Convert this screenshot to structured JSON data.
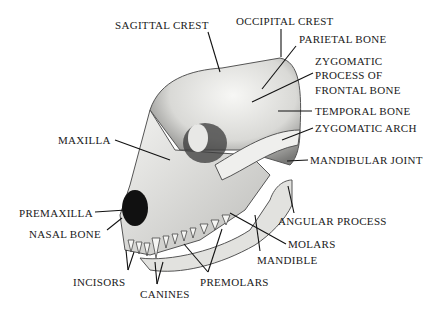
{
  "labels": {
    "sagittal_crest": "SAGITTAL CREST",
    "occipital_crest": "OCCIPITAL CREST",
    "parietal_bone": "PARIETAL BONE",
    "zygomatic_process_line1": "ZYGOMATIC",
    "zygomatic_process_line2": "PROCESS OF",
    "zygomatic_process_line3": "FRONTAL BONE",
    "temporal_bone": "TEMPORAL BONE",
    "zygomatic_arch": "ZYGOMATIC ARCH",
    "maxilla": "MAXILLA",
    "mandibular_joint": "MANDIBULAR JOINT",
    "premaxilla": "PREMAXILLA",
    "nasal_bone": "NASAL BONE",
    "angular_process": "ANGULAR PROCESS",
    "molars": "MOLARS",
    "mandible": "MANDIBLE",
    "incisors": "INCISORS",
    "canines": "CANINES",
    "premolars": "PREMOLARS"
  },
  "colors": {
    "text": "#1a1a1a",
    "line": "#111111",
    "bone": "#e9e9e6",
    "shadow": "#555555"
  }
}
